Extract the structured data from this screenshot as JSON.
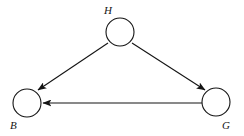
{
  "diagram": {
    "background_color": "#ffffff",
    "stroke_color": "#141414",
    "node_fill_color": "#ffffff",
    "stroke_width": 1.1,
    "node_radius": 14,
    "nodes": [
      {
        "id": "H",
        "label": "H",
        "cx": 120,
        "cy": 32,
        "label_x": 104,
        "label_y": 14
      },
      {
        "id": "B",
        "label": "B",
        "cx": 27,
        "cy": 103,
        "label_x": 10,
        "label_y": 129
      },
      {
        "id": "G",
        "label": "G",
        "cx": 216,
        "cy": 102,
        "label_x": 222,
        "label_y": 129
      }
    ],
    "edges": [
      {
        "id": "H-to-B",
        "from": "H",
        "to": "B",
        "directed": true,
        "x1": 108,
        "y1": 43,
        "x2": 38,
        "y2": 90
      },
      {
        "id": "H-to-G",
        "from": "H",
        "to": "G",
        "directed": true,
        "x1": 132,
        "y1": 43,
        "x2": 205,
        "y2": 90
      },
      {
        "id": "G-to-B",
        "from": "G",
        "to": "B",
        "directed": true,
        "x1": 202,
        "y1": 103,
        "x2": 43,
        "y2": 103
      }
    ]
  }
}
